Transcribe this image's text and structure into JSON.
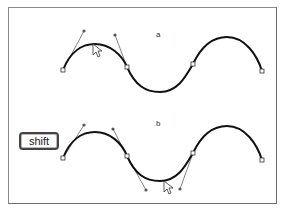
{
  "figure": {
    "panels": [
      {
        "label": "a",
        "description": "Dragging a curve segment adjusts both direction handles of the segment",
        "anchors": [
          [
            63,
            70
          ],
          [
            127,
            67
          ],
          [
            193,
            64
          ],
          [
            262,
            71
          ]
        ],
        "handles": [
          [
            [
              63,
              70
            ],
            [
              84,
              31
            ]
          ],
          [
            [
              127,
              67
            ],
            [
              115,
              35
            ]
          ]
        ],
        "cursor": [
          93,
          44
        ]
      },
      {
        "label": "b",
        "description": "Shift-dragging constrains handle movement",
        "modifier_key": "shift",
        "anchors": [
          [
            63,
            158
          ],
          [
            127,
            156
          ],
          [
            193,
            153
          ],
          [
            262,
            160
          ]
        ],
        "handles": [
          [
            [
              63,
              158
            ],
            [
              84,
              125
            ]
          ],
          [
            [
              127,
              156
            ],
            [
              113,
              129
            ]
          ],
          [
            [
              127,
              156
            ],
            [
              146,
              189
            ]
          ],
          [
            [
              193,
              153
            ],
            [
              180,
              189
            ]
          ]
        ],
        "cursor": [
          164,
          181
        ]
      }
    ],
    "modifier_key_label": "shift",
    "colors": {
      "curve": "#111111",
      "handle": "#666666",
      "frame": "#8a8a8a",
      "anchor_fill": "#ffffff"
    }
  }
}
